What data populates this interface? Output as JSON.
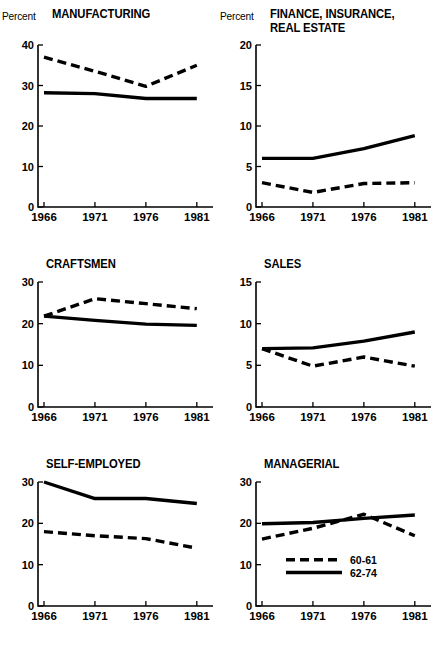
{
  "figure": {
    "percent_label": "Percent",
    "years": [
      "1966",
      "1971",
      "1976",
      "1981"
    ],
    "legend": {
      "dashed_label": "60-61",
      "solid_label": "62-74"
    },
    "ink_color": "#000000",
    "background_color": "#ffffff"
  },
  "chart_data": [
    {
      "type": "line",
      "title": "MANUFACTURING",
      "xlabel": "",
      "ylabel": "Percent",
      "x": [
        1966,
        1971,
        1976,
        1981
      ],
      "xtick_labels": [
        "1966",
        "1971",
        "1976",
        "1981"
      ],
      "ylim": [
        0,
        40
      ],
      "yticks": [
        0,
        10,
        20,
        30,
        40
      ],
      "grid": false,
      "legend_position": "none",
      "series": [
        {
          "name": "60-61",
          "style": "dashed",
          "values": [
            37.0,
            33.5,
            29.8,
            35.0
          ]
        },
        {
          "name": "62-74",
          "style": "solid",
          "values": [
            28.2,
            28.0,
            26.8,
            26.8
          ]
        }
      ]
    },
    {
      "type": "line",
      "title": "FINANCE, INSURANCE,\nREAL ESTATE",
      "xlabel": "",
      "ylabel": "Percent",
      "x": [
        1966,
        1971,
        1976,
        1981
      ],
      "xtick_labels": [
        "1966",
        "1971",
        "1976",
        "1981"
      ],
      "ylim": [
        0,
        20
      ],
      "yticks": [
        0,
        5,
        10,
        15,
        20
      ],
      "grid": false,
      "legend_position": "none",
      "series": [
        {
          "name": "60-61",
          "style": "dashed",
          "values": [
            3.0,
            1.8,
            2.9,
            3.0
          ]
        },
        {
          "name": "62-74",
          "style": "solid",
          "values": [
            6.0,
            6.0,
            7.2,
            8.8
          ]
        }
      ]
    },
    {
      "type": "line",
      "title": "CRAFTSMEN",
      "xlabel": "",
      "ylabel": "",
      "x": [
        1966,
        1971,
        1976,
        1981
      ],
      "xtick_labels": [
        "1966",
        "1971",
        "1976",
        "1981"
      ],
      "ylim": [
        0,
        30
      ],
      "yticks": [
        0,
        10,
        20,
        30
      ],
      "grid": false,
      "legend_position": "none",
      "series": [
        {
          "name": "60-61",
          "style": "dashed",
          "values": [
            21.8,
            26.0,
            24.8,
            23.6
          ]
        },
        {
          "name": "62-74",
          "style": "solid",
          "values": [
            21.8,
            20.8,
            19.9,
            19.6
          ]
        }
      ]
    },
    {
      "type": "line",
      "title": "SALES",
      "xlabel": "",
      "ylabel": "",
      "x": [
        1966,
        1971,
        1976,
        1981
      ],
      "xtick_labels": [
        "1966",
        "1971",
        "1976",
        "1981"
      ],
      "ylim": [
        0,
        15
      ],
      "yticks": [
        0,
        5,
        10,
        15
      ],
      "grid": false,
      "legend_position": "none",
      "series": [
        {
          "name": "60-61",
          "style": "dashed",
          "values": [
            7.0,
            4.9,
            6.0,
            4.9
          ]
        },
        {
          "name": "62-74",
          "style": "solid",
          "values": [
            7.0,
            7.1,
            7.9,
            9.0
          ]
        }
      ]
    },
    {
      "type": "line",
      "title": "SELF-EMPLOYED",
      "xlabel": "",
      "ylabel": "",
      "x": [
        1966,
        1971,
        1976,
        1981
      ],
      "xtick_labels": [
        "1966",
        "1971",
        "1976",
        "1981"
      ],
      "ylim": [
        0,
        30
      ],
      "yticks": [
        0,
        10,
        20,
        30
      ],
      "grid": false,
      "legend_position": "none",
      "series": [
        {
          "name": "60-61",
          "style": "dashed",
          "values": [
            18.0,
            17.0,
            16.3,
            14.0
          ]
        },
        {
          "name": "62-74",
          "style": "solid",
          "values": [
            30.0,
            26.0,
            26.0,
            24.8
          ]
        }
      ]
    },
    {
      "type": "line",
      "title": "MANAGERIAL",
      "xlabel": "",
      "ylabel": "",
      "x": [
        1966,
        1971,
        1976,
        1981
      ],
      "xtick_labels": [
        "1966",
        "1971",
        "1976",
        "1981"
      ],
      "ylim": [
        0,
        30
      ],
      "yticks": [
        0,
        10,
        20,
        30
      ],
      "grid": false,
      "legend_position": "inside-lower-center",
      "series": [
        {
          "name": "60-61",
          "style": "dashed",
          "values": [
            16.2,
            18.8,
            22.2,
            17.0
          ]
        },
        {
          "name": "62-74",
          "style": "solid",
          "values": [
            19.9,
            20.2,
            21.2,
            22.0
          ]
        }
      ]
    }
  ]
}
